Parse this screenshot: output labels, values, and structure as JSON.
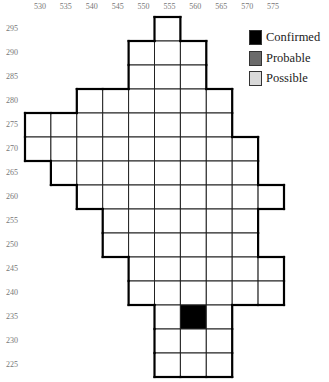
{
  "map": {
    "x_axis_labels": [
      "530",
      "535",
      "540",
      "545",
      "550",
      "555",
      "560",
      "565",
      "570",
      "575"
    ],
    "y_axis_labels": [
      "295",
      "290",
      "285",
      "280",
      "275",
      "270",
      "265",
      "260",
      "255",
      "250",
      "245",
      "240",
      "235",
      "230",
      "225"
    ],
    "cell_size_px": {
      "w": 25.9,
      "h": 24
    },
    "origin_px": {
      "x": 25,
      "y": 17
    },
    "rows": [
      {
        "y": "295",
        "cols": [
          "555"
        ]
      },
      {
        "y": "290",
        "cols": [
          "550",
          "555",
          "560"
        ]
      },
      {
        "y": "285",
        "cols": [
          "550",
          "555",
          "560"
        ]
      },
      {
        "y": "280",
        "cols": [
          "540",
          "545",
          "550",
          "555",
          "560",
          "565"
        ]
      },
      {
        "y": "275",
        "cols": [
          "530",
          "535",
          "540",
          "545",
          "550",
          "555",
          "560",
          "565"
        ]
      },
      {
        "y": "270",
        "cols": [
          "530",
          "535",
          "540",
          "545",
          "550",
          "555",
          "560",
          "565",
          "570"
        ]
      },
      {
        "y": "265",
        "cols": [
          "535",
          "540",
          "545",
          "550",
          "555",
          "560",
          "565",
          "570"
        ]
      },
      {
        "y": "260",
        "cols": [
          "540",
          "545",
          "550",
          "555",
          "560",
          "565",
          "570",
          "575"
        ]
      },
      {
        "y": "255",
        "cols": [
          "545",
          "550",
          "555",
          "560",
          "565",
          "570"
        ]
      },
      {
        "y": "250",
        "cols": [
          "545",
          "550",
          "555",
          "560",
          "565",
          "570"
        ]
      },
      {
        "y": "245",
        "cols": [
          "550",
          "555",
          "560",
          "565",
          "570",
          "575"
        ]
      },
      {
        "y": "240",
        "cols": [
          "550",
          "555",
          "560",
          "565",
          "570",
          "575"
        ]
      },
      {
        "y": "235",
        "cols": [
          "555",
          "560",
          "565"
        ]
      },
      {
        "y": "230",
        "cols": [
          "555",
          "560",
          "565"
        ]
      },
      {
        "y": "225",
        "cols": [
          "555",
          "560",
          "565"
        ]
      }
    ],
    "records": [
      {
        "x": "560",
        "y": "235",
        "status": "confirmed"
      }
    ]
  },
  "legend": {
    "items": [
      {
        "key": "confirmed",
        "label": "Confirmed",
        "color": "#000000"
      },
      {
        "key": "probable",
        "label": "Probable",
        "color": "#6b6b6b"
      },
      {
        "key": "possible",
        "label": "Possible",
        "color": "#d9d9d9"
      }
    ]
  }
}
